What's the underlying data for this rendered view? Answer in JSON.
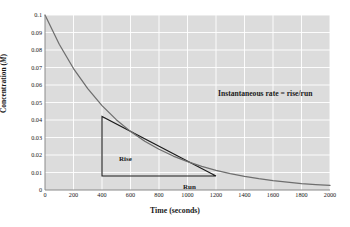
{
  "chart_data": {
    "type": "line",
    "title": "",
    "xlabel": "Time (seconds)",
    "ylabel": "Concentration (M)",
    "ylabel_plain": "Concentration (",
    "ylabel_italic": "M",
    "ylabel_tail": ")",
    "xlim": [
      0,
      2000
    ],
    "ylim": [
      0,
      0.1
    ],
    "xticks": [
      0,
      200,
      400,
      600,
      800,
      1000,
      1200,
      1400,
      1600,
      1800,
      2000
    ],
    "xtick_labels": [
      "0",
      "200",
      "400",
      "600",
      "800",
      "1000",
      "1200",
      "1400",
      "1600",
      "1800",
      "2000"
    ],
    "yticks": [
      0,
      0.01,
      0.02,
      0.03,
      0.04,
      0.05,
      0.06,
      0.07,
      0.08,
      0.09,
      0.1
    ],
    "ytick_labels": [
      "0",
      "0.01",
      "0.02",
      "0.03",
      "0.04",
      "0.05",
      "0.06",
      "0.07",
      "0.08",
      "0.09",
      "0.1"
    ],
    "grid": true,
    "grid_color": "#ffffff",
    "plot_bgcolor": "#dcdcdc",
    "curve_color": "#6e6e6e",
    "tangent_color": "#1a1a1a",
    "series": [
      {
        "name": "Concentration decay",
        "x": [
          0,
          100,
          200,
          300,
          400,
          500,
          600,
          700,
          800,
          900,
          1000,
          1100,
          1200,
          1300,
          1400,
          1500,
          1600,
          1700,
          1800,
          1900,
          2000
        ],
        "values": [
          0.1,
          0.0833,
          0.0694,
          0.0579,
          0.0482,
          0.0402,
          0.0335,
          0.0279,
          0.0233,
          0.0194,
          0.0162,
          0.0135,
          0.0112,
          0.0093,
          0.0078,
          0.0065,
          0.0054,
          0.0045,
          0.0037,
          0.0031,
          0.0026
        ]
      }
    ],
    "annotations": [
      {
        "name": "instantaneous-rate",
        "text": "Instantaneous rate = rise/run",
        "x": 1100,
        "y": 0.066
      },
      {
        "name": "rise",
        "text": "Rise",
        "x": 330,
        "y": 0.025
      },
      {
        "name": "run",
        "text": "Run",
        "x": 790,
        "y": 0.0045
      }
    ],
    "tangent_triangle": {
      "vertex_top": [
        400,
        0.042
      ],
      "vertex_corner": [
        400,
        0.008
      ],
      "vertex_right": [
        1200,
        0.008
      ],
      "rise": 0.034,
      "run": 800
    }
  }
}
